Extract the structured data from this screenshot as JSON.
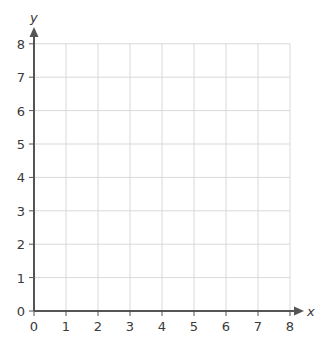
{
  "chart_data": {
    "type": "scatter",
    "title": "",
    "xlabel": "x",
    "ylabel": "y",
    "xlim": [
      0,
      8
    ],
    "ylim": [
      0,
      8
    ],
    "x_ticks": [
      "0",
      "1",
      "2",
      "3",
      "4",
      "5",
      "6",
      "7",
      "8"
    ],
    "y_ticks": [
      "0",
      "1",
      "2",
      "3",
      "4",
      "5",
      "6",
      "7",
      "8"
    ],
    "grid": true,
    "series": []
  },
  "colors": {
    "grid": "#d9d9d9",
    "axis": "#555555",
    "text": "#3a3a3a"
  }
}
